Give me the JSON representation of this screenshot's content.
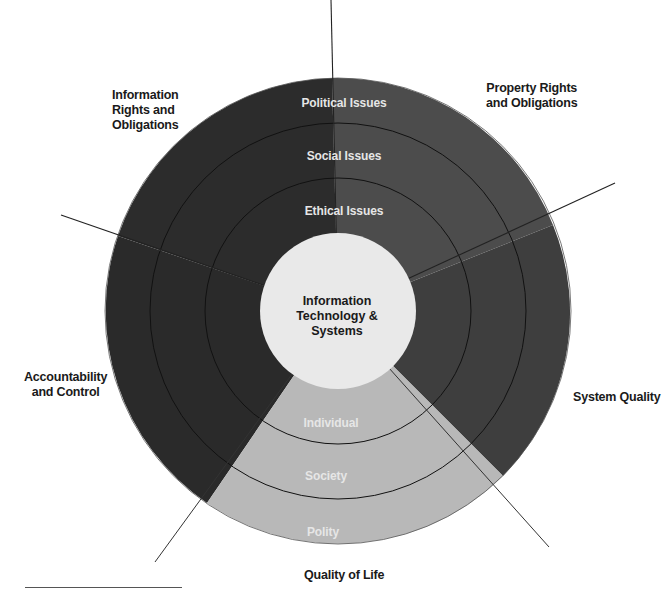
{
  "diagram": {
    "center": {
      "label": "Information\nTechnology &\nSystems"
    },
    "ring_labels_top": {
      "outer": "Political  Issues",
      "middle": "Social  Issues",
      "inner": "Ethical  Issues"
    },
    "ring_labels_bottom": {
      "inner": "Individual",
      "middle": "Society",
      "outer": "Polity"
    },
    "dimensions": [
      {
        "id": "info-rights",
        "label": "Information\nRights and\nObligations"
      },
      {
        "id": "property-rights",
        "label": "Property Rights\nand Obligations"
      },
      {
        "id": "accountability",
        "label": "Accountability\nand Control"
      },
      {
        "id": "system-quality",
        "label": "System Quality"
      },
      {
        "id": "quality-of-life",
        "label": "Quality of Life"
      }
    ],
    "colors": {
      "dark_segment": "#2c2c2c",
      "medium_segment": "#4b4b4b",
      "light_segment": "#b8b8b8",
      "center": "#e9e9e9",
      "line": "#1a1a1a"
    }
  }
}
